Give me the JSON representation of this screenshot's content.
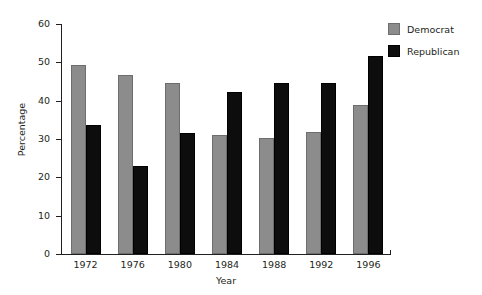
{
  "chart_data": {
    "type": "bar",
    "title": "",
    "subtitle": "",
    "xlabel": "Year",
    "ylabel": "Percentage",
    "categories": [
      "1972",
      "1976",
      "1980",
      "1984",
      "1988",
      "1992",
      "1996"
    ],
    "series": [
      {
        "name": "Democrat",
        "color": "#8c8c8c",
        "values": [
          49.2,
          46.7,
          44.5,
          31.0,
          30.2,
          31.8,
          38.9
        ]
      },
      {
        "name": "Republican",
        "color": "#0d0d0d",
        "values": [
          33.7,
          23.0,
          31.6,
          42.3,
          44.6,
          44.7,
          51.6
        ]
      }
    ],
    "ylim": [
      0,
      60
    ],
    "ytick_values": [
      0,
      10,
      20,
      30,
      40,
      50,
      60
    ],
    "ytick_labels": [
      "0",
      "10",
      "20",
      "30",
      "40",
      "50",
      "60"
    ],
    "grid": false,
    "legend_position": "top-right"
  },
  "legend": {
    "entries": [
      {
        "label": "Democrat",
        "swatch": "democrat-swatch"
      },
      {
        "label": "Republican",
        "swatch": "republican-swatch"
      }
    ]
  }
}
